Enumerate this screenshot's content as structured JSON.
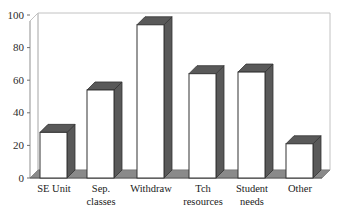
{
  "chart_data": {
    "type": "bar",
    "title": "",
    "subtitle": "",
    "xlabel": "",
    "ylabel": "",
    "categories": [
      "SE Unit",
      "Sep. classes",
      "Withdraw",
      "Tch resources",
      "Student needs",
      "Other"
    ],
    "category_lines": [
      [
        "SE Unit"
      ],
      [
        "Sep.",
        "classes"
      ],
      [
        "Withdraw"
      ],
      [
        "Tch",
        "resources"
      ],
      [
        "Student",
        "needs"
      ],
      [
        "Other"
      ]
    ],
    "values": [
      28,
      54,
      94,
      64,
      65,
      21
    ],
    "ylim": [
      0,
      100
    ],
    "yticks": [
      0,
      20,
      40,
      60,
      80,
      100
    ],
    "ytick_labels": [
      "0",
      "20",
      "40",
      "60",
      "80",
      "100"
    ],
    "grid": false,
    "legend": "none",
    "style": "3d-columns",
    "colors": {
      "bar_face": "#ffffff",
      "bar_side": "#595959",
      "bar_top": "#595959",
      "bar_outline": "#333333",
      "floor": "#8a8a8a",
      "back_wall": "#ffffff",
      "frame": "#b8b8b8",
      "axis": "#6e6e6e",
      "text": "#1a1a1a"
    }
  }
}
